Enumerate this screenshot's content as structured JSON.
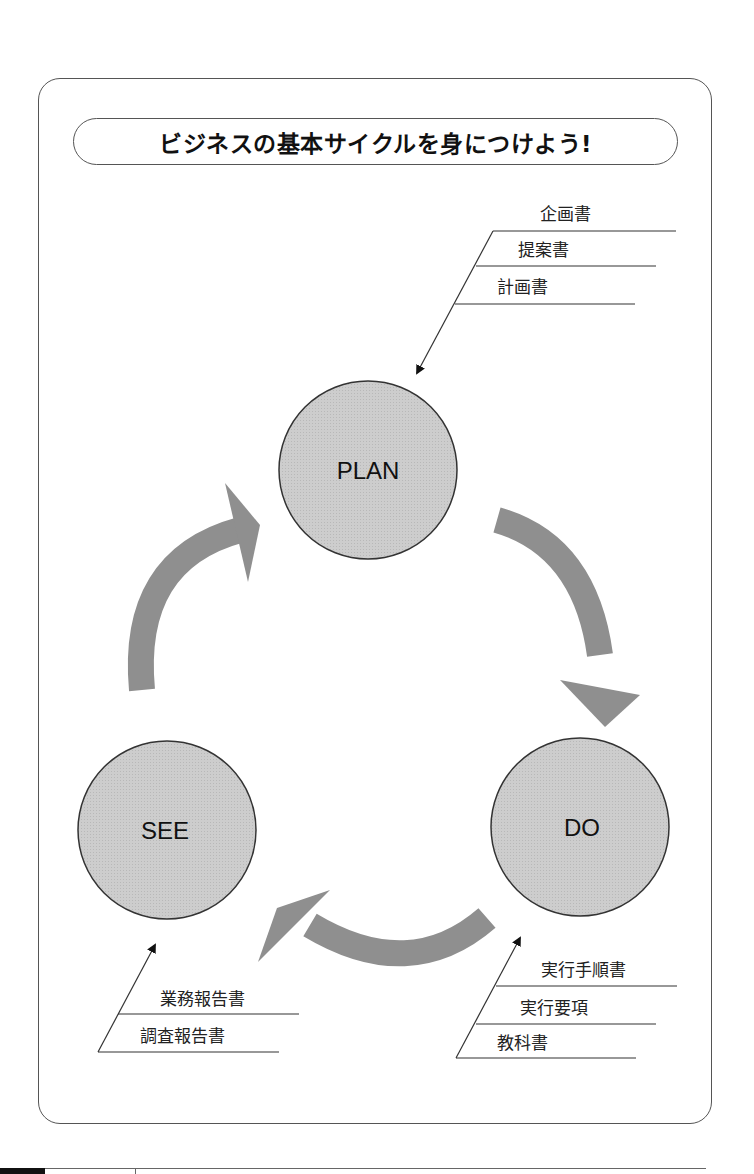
{
  "title": "ビジネスの基本サイクルを身につけよう!",
  "cycle": {
    "nodes": [
      {
        "id": "plan",
        "label": "PLAN"
      },
      {
        "id": "do",
        "label": "DO"
      },
      {
        "id": "see",
        "label": "SEE"
      }
    ],
    "arrows": [
      {
        "from": "PLAN",
        "to": "DO"
      },
      {
        "from": "DO",
        "to": "SEE"
      },
      {
        "from": "SEE",
        "to": "PLAN"
      }
    ]
  },
  "documents": {
    "plan": [
      "企画書",
      "提案書",
      "計画書"
    ],
    "do": [
      "実行手順書",
      "実行要項",
      "教科書"
    ],
    "see": [
      "業務報告書",
      "調査報告書"
    ]
  },
  "colors": {
    "circle_fill": "#c9c9c9",
    "arrow_fill": "#8f8f8f",
    "line": "#333333"
  }
}
